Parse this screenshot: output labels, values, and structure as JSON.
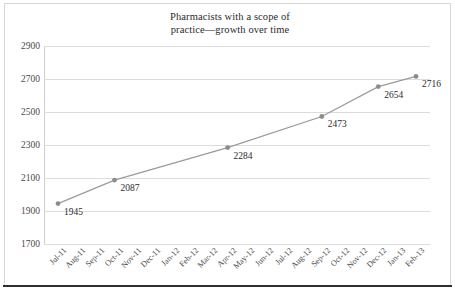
{
  "chart_data": {
    "type": "line",
    "title": "Pharmacists with a scope of practice—growth over time",
    "title_lines": [
      "Pharmacists with a scope of",
      "practice—growth over time"
    ],
    "xlabel": "",
    "ylabel": "",
    "ylim": [
      1700,
      2900
    ],
    "yticks": [
      2900,
      2700,
      2500,
      2300,
      2100,
      1900,
      1700
    ],
    "grid": true,
    "legend": "none",
    "categories": [
      "Jul-11",
      "Aug-11",
      "Sep-11",
      "Oct-11",
      "Nov-11",
      "Dec-11",
      "Jan-12",
      "Feb-12",
      "Mar-12",
      "Apr-12",
      "May-12",
      "Jun-12",
      "Jul-12",
      "Aug-12",
      "Sep-12",
      "Oct-12",
      "Nov-12",
      "Dec-12",
      "Jan-13",
      "Feb-13"
    ],
    "points": [
      {
        "x": "Jul-11",
        "index": 0,
        "value": 1945,
        "label": "1945"
      },
      {
        "x": "Oct-11",
        "index": 3,
        "value": 2087,
        "label": "2087"
      },
      {
        "x": "Apr-12",
        "index": 9,
        "value": 2284,
        "label": "2284"
      },
      {
        "x": "Sep-12",
        "index": 14,
        "value": 2473,
        "label": "2473"
      },
      {
        "x": "Dec-12",
        "index": 17,
        "value": 2654,
        "label": "2654"
      },
      {
        "x": "Feb-13",
        "index": 19,
        "value": 2716,
        "label": "2716"
      }
    ],
    "series": [
      {
        "name": "Pharmacists with a scope of practice",
        "values": [
          1945,
          null,
          null,
          2087,
          null,
          null,
          null,
          null,
          null,
          2284,
          null,
          null,
          null,
          null,
          2473,
          null,
          null,
          2654,
          null,
          2716
        ]
      }
    ],
    "colors": {
      "line": "#9a9a9a",
      "marker": "#8c8c8c",
      "grid": "#dcdcdc",
      "axis": "#cfcfcf",
      "text": "#2b2b2b",
      "frame": "#2e2e2e",
      "background": "#ffffff"
    }
  }
}
